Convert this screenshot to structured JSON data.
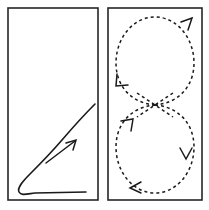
{
  "figure": {
    "width": 209,
    "height": 210,
    "background_color": "#ffffff",
    "ink_color": "#1a1a1a",
    "frame_color": "#262626"
  },
  "panels": [
    {
      "id": "left-panel",
      "name": "solid-trajectory-panel",
      "label": "",
      "frame": {
        "x": 8,
        "y": 8,
        "width": 90,
        "height": 192
      },
      "stroke_style": "solid",
      "stroke_width": 1.6,
      "description": "Single solid curve: horizontal baseline that hooks around at the left into a rising diagonal.",
      "path": "M 95 104 C 86 113 74 126 62 140 C 50 154 38 166 30 174 C 22 182 17 188 19 192 C 21 196 27 194 35 193 L 86 192",
      "arrows": [
        {
          "name": "direction-arrow",
          "kind": "straight-segment-with-head",
          "shaft": "M 46 163 L 75 141",
          "head": "M 66 143 L 76 140 L 73 150",
          "points_to": "up-right",
          "stroke_width": 1.5
        }
      ]
    },
    {
      "id": "right-panel",
      "name": "dashed-figure-eight-panel",
      "label": "",
      "frame": {
        "x": 108,
        "y": 8,
        "width": 94,
        "height": 192
      },
      "stroke_style": "dashed",
      "stroke_width": 1.5,
      "dash_pattern": "3 3",
      "description": "Dashed figure-eight made of two circular loops crossing near the vertical middle.",
      "loops": [
        {
          "name": "upper-loop",
          "center_x": 155,
          "center_y": 62,
          "radius_x": 41,
          "radius_y": 46,
          "crossing_y": 105,
          "path": "M 155 105 C 131 103 116 86 116 63 C 116 38 133 17 155 17 C 177 17 194 38 194 63 C 194 86 179 103 155 105"
        },
        {
          "name": "lower-loop",
          "center_x": 155,
          "center_y": 148,
          "radius_x": 41,
          "radius_y": 46,
          "crossing_y": 105,
          "path": "M 155 105 C 179 107 194 124 194 147 C 194 172 177 193 155 193 C 133 193 116 172 116 147 C 116 124 131 107 155 105"
        }
      ],
      "crossing": {
        "name": "loop-crossing",
        "x": 155,
        "y": 105,
        "left_stroke": "M 137 93 L 173 117",
        "right_stroke": "M 173 93 L 137 117"
      },
      "arrows": [
        {
          "name": "upper-loop-top-right-arrow",
          "head": "M 181 22 L 192 18 L 188 30",
          "points_to": "up-right",
          "stroke_width": 1.5
        },
        {
          "name": "upper-loop-left-arrow",
          "head": "M 117 74 L 116 86 L 128 85",
          "points_to": "down-left",
          "stroke_width": 1.5
        },
        {
          "name": "lower-loop-upper-left-arrow",
          "head": "M 121 121 L 133 119 L 131 131",
          "points_to": "up-right",
          "stroke_width": 1.5
        },
        {
          "name": "lower-loop-right-arrow",
          "head": "M 180 148 L 186 159 L 192 148",
          "points_to": "down",
          "stroke_width": 1.5
        },
        {
          "name": "lower-loop-bottom-arrow",
          "head": "M 141 182 L 130 188 L 141 193",
          "points_to": "left",
          "stroke_width": 1.5
        }
      ]
    }
  ]
}
